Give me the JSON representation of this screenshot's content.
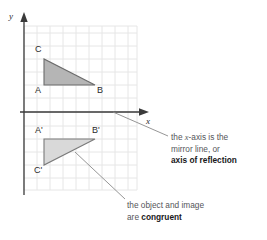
{
  "figure": {
    "type": "reflection-diagram",
    "background_color": "#ffffff",
    "grid": {
      "color": "#e6e6e6",
      "cell_size": 13,
      "left": 24,
      "top": 26,
      "right": 137,
      "bottom": 190,
      "cols": 9,
      "rows": 13
    },
    "axes": {
      "color": "#3a3a3a",
      "y_axis_label": "y",
      "x_axis_label": "x",
      "origin_x": 24,
      "origin_y": 112
    },
    "shapes": [
      {
        "name": "object-triangle",
        "fill": "#b5b5b5",
        "stroke": "#6b6b6b",
        "vertices": [
          {
            "label": "C",
            "x": 44,
            "y": 59
          },
          {
            "label": "A",
            "x": 44,
            "y": 85
          },
          {
            "label": "B",
            "x": 95,
            "y": 85
          }
        ]
      },
      {
        "name": "image-triangle",
        "fill": "#d9d9d9",
        "stroke": "#7a7a7a",
        "vertices": [
          {
            "label": "A'",
            "x": 44,
            "y": 139
          },
          {
            "label": "B'",
            "x": 95,
            "y": 139
          },
          {
            "label": "C'",
            "x": 44,
            "y": 165
          }
        ]
      }
    ],
    "vertex_labels": [
      {
        "text": "C",
        "x": 35,
        "y": 45
      },
      {
        "text": "A",
        "x": 35,
        "y": 86
      },
      {
        "text": "B",
        "x": 97,
        "y": 86
      },
      {
        "text": "A'",
        "x": 35,
        "y": 126
      },
      {
        "text": "B'",
        "x": 93,
        "y": 126
      },
      {
        "text": "C'",
        "x": 34,
        "y": 166
      }
    ],
    "annotations": [
      {
        "name": "mirror-line-note",
        "line1_prefix": "the ",
        "line1_italic": "x",
        "line1_suffix": "-axis is the",
        "line2": "mirror line, or",
        "line3_bold": "axis of reflection",
        "x": 171,
        "y": 132,
        "leader": {
          "x1": 113,
          "y1": 112,
          "x2": 168,
          "y2": 136
        }
      },
      {
        "name": "congruent-note",
        "line1": "the object and image",
        "line2_prefix": "are ",
        "line2_bold": "congruent",
        "x": 127,
        "y": 200,
        "leader": {
          "x1": 75,
          "y1": 152,
          "x2": 125,
          "y2": 200
        }
      }
    ]
  }
}
